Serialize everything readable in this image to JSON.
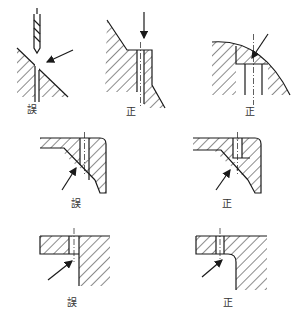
{
  "colors": {
    "line": "#1a1a1a",
    "label": "#333333"
  },
  "panels": [
    {
      "id": "p1",
      "verdict": "wrong",
      "label": "誤",
      "description": "drill entering inclined surface"
    },
    {
      "id": "p2",
      "verdict": "correct",
      "label": "正",
      "description": "flat spot-face on inclined surface"
    },
    {
      "id": "p3",
      "verdict": "correct",
      "label": "正",
      "description": "flat boss on curved surface"
    },
    {
      "id": "p4",
      "verdict": "wrong",
      "label": "誤",
      "description": "hole breaking through chamfered inner corner"
    },
    {
      "id": "p5",
      "verdict": "correct",
      "label": "正",
      "description": "hole with thickened inner corner"
    },
    {
      "id": "p6",
      "verdict": "wrong",
      "label": "誤",
      "description": "hole tangent to inner wall"
    },
    {
      "id": "p7",
      "verdict": "correct",
      "label": "正",
      "description": "hole clear of inner wall with fillet"
    }
  ]
}
